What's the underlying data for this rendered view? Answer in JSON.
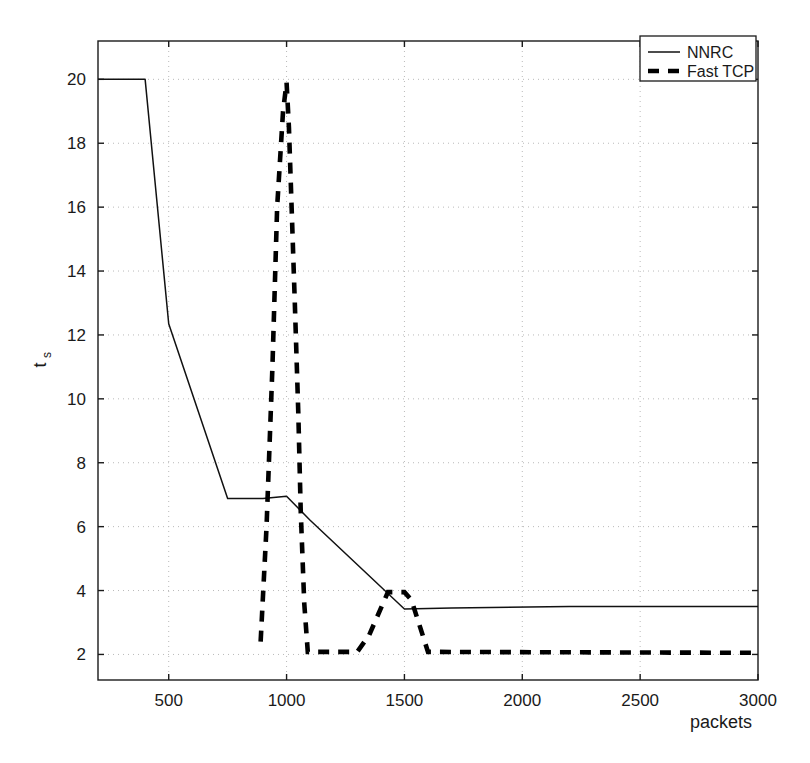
{
  "chart_data": {
    "type": "line",
    "title": "",
    "xlabel": "packets",
    "ylabel": "t_s",
    "ylabel_base": "t",
    "ylabel_sub": "s",
    "xlim": [
      200,
      3000
    ],
    "ylim": [
      1.2,
      21.2
    ],
    "grid": true,
    "xticks": [
      500,
      1000,
      1500,
      2000,
      2500,
      3000
    ],
    "xtick_labels": [
      "500",
      "1000",
      "1500",
      "2000",
      "2500",
      "3000"
    ],
    "yticks": [
      2,
      4,
      6,
      8,
      10,
      12,
      14,
      16,
      18,
      20
    ],
    "ytick_labels": [
      "2",
      "4",
      "6",
      "8",
      "10",
      "12",
      "14",
      "16",
      "18",
      "20"
    ],
    "legend_position": "top-right",
    "series": [
      {
        "name": "NNRC",
        "style": "solid",
        "color": "#111111",
        "points": [
          [
            200,
            20.0
          ],
          [
            400,
            20.0
          ],
          [
            500,
            12.35
          ],
          [
            750,
            6.88
          ],
          [
            900,
            6.88
          ],
          [
            1000,
            6.95
          ],
          [
            1100,
            6.2
          ],
          [
            1500,
            3.42
          ],
          [
            1700,
            3.45
          ],
          [
            2200,
            3.5
          ],
          [
            3000,
            3.5
          ]
        ]
      },
      {
        "name": "Fast TCP",
        "style": "dashed",
        "color": "#000000",
        "points": [
          [
            890,
            2.4
          ],
          [
            915,
            6.0
          ],
          [
            940,
            11.0
          ],
          [
            960,
            16.0
          ],
          [
            985,
            19.0
          ],
          [
            1000,
            19.9
          ],
          [
            1010,
            18.5
          ],
          [
            1020,
            16.3
          ],
          [
            1035,
            13.0
          ],
          [
            1050,
            9.5
          ],
          [
            1060,
            6.5
          ],
          [
            1075,
            3.6
          ],
          [
            1090,
            2.08
          ],
          [
            1300,
            2.08
          ],
          [
            1350,
            2.6
          ],
          [
            1430,
            3.95
          ],
          [
            1500,
            3.95
          ],
          [
            1530,
            3.7
          ],
          [
            1600,
            2.08
          ],
          [
            3000,
            2.05
          ]
        ]
      }
    ]
  },
  "legend": {
    "entries": [
      {
        "label": "NNRC",
        "style": "solid"
      },
      {
        "label": "Fast TCP",
        "style": "dashed"
      }
    ]
  }
}
